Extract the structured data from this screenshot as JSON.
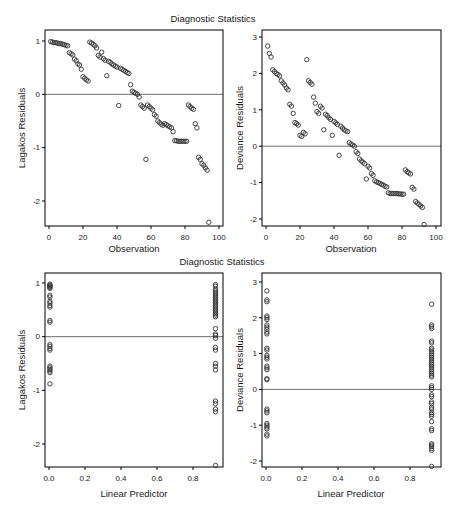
{
  "row_titles": [
    "Diagnostic Statistics",
    "Diagnostic Statistics"
  ],
  "colors": {
    "background": "#ffffff",
    "frame": "#000000",
    "point": "#333333",
    "ref_line": "#6e6e6e",
    "text": "#1a1a1a"
  },
  "chart_data": [
    {
      "id": "lagakos-vs-observation",
      "type": "scatter",
      "row_title": "Diagnostic Statistics",
      "xlabel": "Observation",
      "ylabel": "Lagakos Residuals",
      "xticks": [
        0,
        20,
        40,
        60,
        80,
        100
      ],
      "xtick_labels": [
        "0",
        "20",
        "40",
        "60",
        "80",
        "100"
      ],
      "yticks": [
        1,
        0,
        -1,
        -2
      ],
      "ytick_labels": [
        "1",
        "0",
        "-1",
        "-2"
      ],
      "xlim": [
        -2.4,
        102.4
      ],
      "ylim": [
        -2.5,
        1.2
      ],
      "ref_line_y": 0,
      "marker": "open-circle",
      "points": [
        [
          1,
          0.99
        ],
        [
          2,
          0.98
        ],
        [
          3,
          0.97
        ],
        [
          4,
          0.97
        ],
        [
          5,
          0.96
        ],
        [
          6,
          0.95
        ],
        [
          7,
          0.95
        ],
        [
          8,
          0.94
        ],
        [
          9,
          0.93
        ],
        [
          10,
          0.92
        ],
        [
          11,
          0.91
        ],
        [
          12,
          0.78
        ],
        [
          13,
          0.76
        ],
        [
          14,
          0.74
        ],
        [
          15,
          0.66
        ],
        [
          16,
          0.63
        ],
        [
          17,
          0.57
        ],
        [
          18,
          0.55
        ],
        [
          19,
          0.47
        ],
        [
          20,
          0.33
        ],
        [
          21,
          0.3
        ],
        [
          22,
          0.27
        ],
        [
          23,
          0.25
        ],
        [
          24,
          0.98
        ],
        [
          25,
          0.96
        ],
        [
          26,
          0.94
        ],
        [
          27,
          0.91
        ],
        [
          28,
          0.87
        ],
        [
          29,
          0.73
        ],
        [
          30,
          0.7
        ],
        [
          31,
          0.79
        ],
        [
          32,
          0.67
        ],
        [
          33,
          0.64
        ],
        [
          34,
          0.35
        ],
        [
          35,
          0.62
        ],
        [
          36,
          0.6
        ],
        [
          37,
          0.57
        ],
        [
          38,
          0.55
        ],
        [
          39,
          0.53
        ],
        [
          40,
          0.51
        ],
        [
          41,
          -0.21
        ],
        [
          42,
          0.49
        ],
        [
          43,
          0.47
        ],
        [
          44,
          0.45
        ],
        [
          45,
          0.43
        ],
        [
          46,
          0.41
        ],
        [
          47,
          0.39
        ],
        [
          48,
          0.18
        ],
        [
          49,
          0.06
        ],
        [
          50,
          0.04
        ],
        [
          51,
          0.02
        ],
        [
          52,
          0
        ],
        [
          53,
          -0.05
        ],
        [
          54,
          -0.2
        ],
        [
          55,
          -0.23
        ],
        [
          56,
          -0.26
        ],
        [
          57,
          -1.22
        ],
        [
          58,
          -0.2
        ],
        [
          59,
          -0.23
        ],
        [
          60,
          -0.26
        ],
        [
          61,
          -0.29
        ],
        [
          62,
          -0.38
        ],
        [
          63,
          -0.41
        ],
        [
          64,
          -0.5
        ],
        [
          65,
          -0.53
        ],
        [
          66,
          -0.56
        ],
        [
          67,
          -0.58
        ],
        [
          68,
          -0.55
        ],
        [
          69,
          -0.57
        ],
        [
          70,
          -0.59
        ],
        [
          71,
          -0.61
        ],
        [
          72,
          -0.63
        ],
        [
          73,
          -0.7
        ],
        [
          74,
          -0.87
        ],
        [
          75,
          -0.87
        ],
        [
          76,
          -0.88
        ],
        [
          77,
          -0.88
        ],
        [
          78,
          -0.88
        ],
        [
          79,
          -0.88
        ],
        [
          80,
          -0.88
        ],
        [
          81,
          -0.88
        ],
        [
          82,
          -0.2
        ],
        [
          83,
          -0.23
        ],
        [
          84,
          -0.26
        ],
        [
          85,
          -0.28
        ],
        [
          86,
          -0.55
        ],
        [
          87,
          -0.63
        ],
        [
          88,
          -1.18
        ],
        [
          89,
          -1.22
        ],
        [
          90,
          -1.3
        ],
        [
          91,
          -1.33
        ],
        [
          92,
          -1.38
        ],
        [
          93,
          -1.42
        ],
        [
          94,
          -2.4
        ]
      ]
    },
    {
      "id": "deviance-vs-observation",
      "type": "scatter",
      "row_title": "Diagnostic Statistics",
      "xlabel": "Observation",
      "ylabel": "Deviance Residuals",
      "xticks": [
        0,
        20,
        40,
        60,
        80,
        100
      ],
      "xtick_labels": [
        "0",
        "20",
        "40",
        "60",
        "80",
        "100"
      ],
      "yticks": [
        3,
        2,
        1,
        0,
        -1,
        -2
      ],
      "ytick_labels": [
        "3",
        "2",
        "1",
        "0",
        "-1",
        "-2"
      ],
      "xlim": [
        -2.4,
        102.4
      ],
      "ylim": [
        -2.2,
        3.2
      ],
      "ref_line_y": 0,
      "marker": "open-circle",
      "points": [
        [
          1,
          2.75
        ],
        [
          2,
          2.55
        ],
        [
          3,
          2.45
        ],
        [
          4,
          2.1
        ],
        [
          5,
          2.05
        ],
        [
          6,
          2
        ],
        [
          7,
          1.97
        ],
        [
          8,
          1.93
        ],
        [
          9,
          1.8
        ],
        [
          10,
          1.74
        ],
        [
          11,
          1.68
        ],
        [
          12,
          1.6
        ],
        [
          13,
          1.55
        ],
        [
          14,
          1.15
        ],
        [
          15,
          1.1
        ],
        [
          16,
          0.9
        ],
        [
          17,
          0.65
        ],
        [
          18,
          0.62
        ],
        [
          19,
          0.58
        ],
        [
          20,
          0.3
        ],
        [
          21,
          0.27
        ],
        [
          22,
          0.38
        ],
        [
          23,
          0.34
        ],
        [
          24,
          2.38
        ],
        [
          25,
          1.8
        ],
        [
          26,
          1.75
        ],
        [
          27,
          1.7
        ],
        [
          28,
          1.35
        ],
        [
          29,
          1.18
        ],
        [
          30,
          0.95
        ],
        [
          31,
          0.9
        ],
        [
          32,
          1.1
        ],
        [
          33,
          1.05
        ],
        [
          34,
          0.45
        ],
        [
          35,
          0.88
        ],
        [
          36,
          0.84
        ],
        [
          37,
          0.78
        ],
        [
          38,
          0.74
        ],
        [
          39,
          0.3
        ],
        [
          40,
          0.68
        ],
        [
          41,
          0.64
        ],
        [
          42,
          0.6
        ],
        [
          43,
          -0.25
        ],
        [
          44,
          0.55
        ],
        [
          45,
          0.5
        ],
        [
          46,
          0.45
        ],
        [
          47,
          0.42
        ],
        [
          48,
          0.4
        ],
        [
          49,
          0.1
        ],
        [
          50,
          0.06
        ],
        [
          51,
          0.03
        ],
        [
          52,
          0
        ],
        [
          53,
          -0.15
        ],
        [
          54,
          -0.2
        ],
        [
          55,
          -0.35
        ],
        [
          56,
          -0.4
        ],
        [
          57,
          -0.44
        ],
        [
          58,
          -0.48
        ],
        [
          59,
          -0.9
        ],
        [
          60,
          -0.55
        ],
        [
          61,
          -0.6
        ],
        [
          62,
          -0.75
        ],
        [
          63,
          -0.8
        ],
        [
          64,
          -0.95
        ],
        [
          65,
          -0.98
        ],
        [
          66,
          -1
        ],
        [
          67,
          -1.02
        ],
        [
          68,
          -1.05
        ],
        [
          69,
          -1.07
        ],
        [
          70,
          -1.1
        ],
        [
          71,
          -1.12
        ],
        [
          72,
          -1.28
        ],
        [
          73,
          -1.3
        ],
        [
          74,
          -1.3
        ],
        [
          75,
          -1.3
        ],
        [
          76,
          -1.3
        ],
        [
          77,
          -1.3
        ],
        [
          78,
          -1.31
        ],
        [
          79,
          -1.31
        ],
        [
          80,
          -1.32
        ],
        [
          81,
          -1.32
        ],
        [
          82,
          -0.65
        ],
        [
          83,
          -0.7
        ],
        [
          84,
          -0.73
        ],
        [
          85,
          -0.76
        ],
        [
          86,
          -1.13
        ],
        [
          87,
          -1.18
        ],
        [
          88,
          -1.52
        ],
        [
          89,
          -1.56
        ],
        [
          90,
          -1.6
        ],
        [
          91,
          -1.64
        ],
        [
          92,
          -1.68
        ],
        [
          93,
          -2.15
        ]
      ]
    },
    {
      "id": "lagakos-vs-linear-predictor",
      "type": "scatter",
      "row_title": "Diagnostic Statistics",
      "xlabel": "Linear Predictor",
      "ylabel": "Lagakos Residuals",
      "xticks": [
        0,
        0.2,
        0.4,
        0.6,
        0.8
      ],
      "xtick_labels": [
        "0.0",
        "0.2",
        "0.4",
        "0.6",
        "0.8"
      ],
      "yticks": [
        1,
        0,
        -1,
        -2
      ],
      "ytick_labels": [
        "1",
        "0",
        "-1",
        "-2"
      ],
      "xlim": [
        -0.02,
        0.97
      ],
      "ylim": [
        -2.45,
        1.2
      ],
      "ref_line_y": 0,
      "marker": "open-circle",
      "points": [
        [
          0.005,
          0.98
        ],
        [
          0.005,
          0.96
        ],
        [
          0.005,
          0.95
        ],
        [
          0.005,
          0.93
        ],
        [
          0.005,
          0.92
        ],
        [
          0.005,
          0.9
        ],
        [
          0.005,
          0.77
        ],
        [
          0.005,
          0.74
        ],
        [
          0.005,
          0.66
        ],
        [
          0.005,
          0.63
        ],
        [
          0.005,
          0.58
        ],
        [
          0.005,
          0.55
        ],
        [
          0.005,
          0.3
        ],
        [
          0.005,
          0.27
        ],
        [
          0.005,
          -0.15
        ],
        [
          0.005,
          -0.18
        ],
        [
          0.005,
          -0.22
        ],
        [
          0.005,
          -0.25
        ],
        [
          0.005,
          -0.55
        ],
        [
          0.005,
          -0.58
        ],
        [
          0.005,
          -0.61
        ],
        [
          0.005,
          -0.64
        ],
        [
          0.005,
          -0.67
        ],
        [
          0.005,
          -0.88
        ],
        [
          0.925,
          0.97
        ],
        [
          0.925,
          0.94
        ],
        [
          0.925,
          0.88
        ],
        [
          0.925,
          0.85
        ],
        [
          0.925,
          0.82
        ],
        [
          0.925,
          0.79
        ],
        [
          0.925,
          0.76
        ],
        [
          0.925,
          0.73
        ],
        [
          0.925,
          0.7
        ],
        [
          0.925,
          0.67
        ],
        [
          0.925,
          0.64
        ],
        [
          0.925,
          0.61
        ],
        [
          0.925,
          0.58
        ],
        [
          0.925,
          0.55
        ],
        [
          0.925,
          0.52
        ],
        [
          0.925,
          0.49
        ],
        [
          0.925,
          0.46
        ],
        [
          0.925,
          0.43
        ],
        [
          0.925,
          0.4
        ],
        [
          0.925,
          0.37
        ],
        [
          0.925,
          0.15
        ],
        [
          0.925,
          0.05
        ],
        [
          0.925,
          0.02
        ],
        [
          0.925,
          -0.03
        ],
        [
          0.925,
          -0.2
        ],
        [
          0.925,
          -0.25
        ],
        [
          0.925,
          -0.5
        ],
        [
          0.925,
          -0.55
        ],
        [
          0.925,
          -0.62
        ],
        [
          0.925,
          -1.2
        ],
        [
          0.925,
          -1.25
        ],
        [
          0.925,
          -1.35
        ],
        [
          0.925,
          -1.4
        ],
        [
          0.925,
          -2.4
        ]
      ]
    },
    {
      "id": "deviance-vs-linear-predictor",
      "type": "scatter",
      "row_title": "Diagnostic Statistics",
      "xlabel": "Linear Predictor",
      "ylabel": "Deviance Residuals",
      "xticks": [
        0,
        0.2,
        0.4,
        0.6,
        0.8
      ],
      "xtick_labels": [
        "0.0",
        "0.2",
        "0.4",
        "0.6",
        "0.8"
      ],
      "yticks": [
        3,
        2,
        1,
        0,
        -1,
        -2
      ],
      "ytick_labels": [
        "3",
        "2",
        "1",
        "0",
        "-1",
        "-2"
      ],
      "xlim": [
        -0.02,
        0.97
      ],
      "ylim": [
        -2.2,
        3.25
      ],
      "ref_line_y": 0,
      "marker": "open-circle",
      "points": [
        [
          0.005,
          2.75
        ],
        [
          0.005,
          2.5
        ],
        [
          0.005,
          2.45
        ],
        [
          0.005,
          2.05
        ],
        [
          0.005,
          2
        ],
        [
          0.005,
          1.95
        ],
        [
          0.005,
          1.8
        ],
        [
          0.005,
          1.74
        ],
        [
          0.005,
          1.68
        ],
        [
          0.005,
          1.6
        ],
        [
          0.005,
          1.55
        ],
        [
          0.005,
          1.15
        ],
        [
          0.005,
          1.1
        ],
        [
          0.005,
          0.95
        ],
        [
          0.005,
          0.9
        ],
        [
          0.005,
          0.85
        ],
        [
          0.005,
          0.65
        ],
        [
          0.005,
          0.6
        ],
        [
          0.005,
          0.55
        ],
        [
          0.005,
          0.3
        ],
        [
          0.005,
          0.27
        ],
        [
          0.005,
          -0.55
        ],
        [
          0.005,
          -0.6
        ],
        [
          0.005,
          -0.65
        ],
        [
          0.005,
          -0.95
        ],
        [
          0.005,
          -1
        ],
        [
          0.005,
          -1.05
        ],
        [
          0.005,
          -1.1
        ],
        [
          0.005,
          -1.25
        ],
        [
          0.005,
          -1.3
        ],
        [
          0.92,
          2.38
        ],
        [
          0.92,
          1.8
        ],
        [
          0.92,
          1.75
        ],
        [
          0.92,
          1.7
        ],
        [
          0.92,
          1.35
        ],
        [
          0.92,
          1.3
        ],
        [
          0.92,
          1.15
        ],
        [
          0.92,
          1.1
        ],
        [
          0.92,
          1.05
        ],
        [
          0.92,
          1
        ],
        [
          0.92,
          0.95
        ],
        [
          0.92,
          0.9
        ],
        [
          0.92,
          0.85
        ],
        [
          0.92,
          0.8
        ],
        [
          0.92,
          0.75
        ],
        [
          0.92,
          0.7
        ],
        [
          0.92,
          0.65
        ],
        [
          0.92,
          0.6
        ],
        [
          0.92,
          0.55
        ],
        [
          0.92,
          0.5
        ],
        [
          0.92,
          0.45
        ],
        [
          0.92,
          0.4
        ],
        [
          0.92,
          0.35
        ],
        [
          0.92,
          0.1
        ],
        [
          0.92,
          0.05
        ],
        [
          0.92,
          0
        ],
        [
          0.92,
          -0.15
        ],
        [
          0.92,
          -0.2
        ],
        [
          0.92,
          -0.35
        ],
        [
          0.92,
          -0.4
        ],
        [
          0.92,
          -0.5
        ],
        [
          0.92,
          -0.55
        ],
        [
          0.92,
          -0.65
        ],
        [
          0.92,
          -0.7
        ],
        [
          0.92,
          -0.75
        ],
        [
          0.92,
          -0.9
        ],
        [
          0.92,
          -1.1
        ],
        [
          0.92,
          -1.15
        ],
        [
          0.92,
          -1.52
        ],
        [
          0.92,
          -1.56
        ],
        [
          0.92,
          -1.6
        ],
        [
          0.92,
          -1.65
        ],
        [
          0.92,
          -1.7
        ],
        [
          0.92,
          -2.15
        ]
      ]
    }
  ]
}
